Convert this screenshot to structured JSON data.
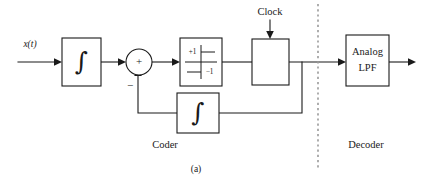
{
  "figure": {
    "caption": "(a)",
    "sections": {
      "left_label": "Coder",
      "right_label": "Decoder"
    },
    "input_signal_label": "x(t)",
    "clock_label": "Clock",
    "summer": {
      "plus_sign": "+",
      "minus_sign": "−"
    },
    "blocks": {
      "forward_integrator": {
        "symbol": "∫",
        "name": "integrator"
      },
      "quantizer": {
        "upper_level": "+1",
        "lower_level": "−1",
        "name": "two-level-quantizer"
      },
      "sampler": {
        "label": "",
        "name": "sampler"
      },
      "feedback_integrator": {
        "symbol": "∫",
        "name": "feedback-integrator"
      },
      "lowpass_filter": {
        "line1": "Analog",
        "line2": "LPF"
      }
    }
  },
  "colors": {
    "background": "#ffffff",
    "ink": "#1a1a1a",
    "divider": "#9a9a9a"
  }
}
